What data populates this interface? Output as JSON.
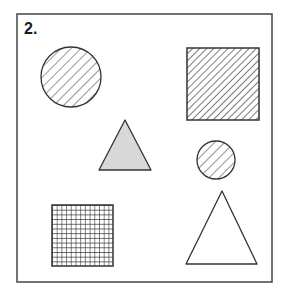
{
  "figure": {
    "label": "2.",
    "stroke_color": "#333333",
    "frame_color": "#444444",
    "gray_fill": "#d9d9d9",
    "background": "#ffffff",
    "shapes": [
      {
        "id": "large-hatched-circle",
        "type": "circle",
        "fill": "diagonal-hatch",
        "cx": 71,
        "cy": 77,
        "r": 30
      },
      {
        "id": "hatched-square",
        "type": "square",
        "fill": "diagonal-hatch-dense",
        "x": 187,
        "y": 48,
        "size": 72
      },
      {
        "id": "gray-triangle",
        "type": "triangle",
        "fill": "gray",
        "points": [
          [
            125,
            120
          ],
          [
            99,
            170
          ],
          [
            151,
            170
          ]
        ]
      },
      {
        "id": "small-hatched-circle",
        "type": "circle",
        "fill": "diagonal-hatch",
        "cx": 216,
        "cy": 160,
        "r": 19
      },
      {
        "id": "grid-square",
        "type": "square",
        "fill": "grid",
        "x": 52,
        "y": 205,
        "size": 61
      },
      {
        "id": "outline-triangle",
        "type": "triangle",
        "fill": "none",
        "points": [
          [
            222,
            191
          ],
          [
            186,
            264
          ],
          [
            257,
            264
          ]
        ]
      }
    ]
  }
}
